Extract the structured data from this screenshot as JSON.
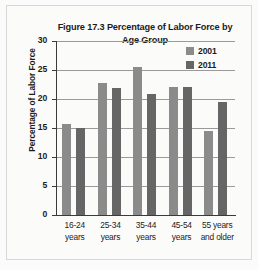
{
  "figure": {
    "title": "Figure 17.3 Percentage of Labor Force by Age Group",
    "title_line1": "Figure 17.3 Percentage of Labor Force",
    "title_line2": "by Age Group",
    "y_axis_title": "Percentage of Labor Force",
    "colors": {
      "series_2001": "#8b8b8b",
      "series_2011": "#666666",
      "gridline": "#9a9a9a",
      "axis": "#3a3a3a",
      "text": "#1c1c1c",
      "background": "#fbfbfa",
      "frame_border": "#d8d8d6"
    },
    "legend": [
      {
        "label": "2001",
        "color": "#8b8b8b"
      },
      {
        "label": "2011",
        "color": "#666666"
      }
    ],
    "y_ticks": [
      "30",
      "25",
      "20",
      "15",
      "10",
      "5",
      "0"
    ],
    "x_tick_labels": [
      {
        "line1": "16-24",
        "line2": "years"
      },
      {
        "line1": "25-34",
        "line2": "years"
      },
      {
        "line1": "35-44",
        "line2": "years"
      },
      {
        "line1": "45-54",
        "line2": "years"
      },
      {
        "line1": "55 years",
        "line2": "and older"
      }
    ]
  },
  "chart_data": {
    "type": "bar",
    "title": "Figure 17.3 Percentage of Labor Force by Age Group",
    "xlabel": "",
    "ylabel": "Percentage of Labor Force",
    "categories": [
      "16-24 years",
      "25-34 years",
      "35-44 years",
      "45-54 years",
      "55 years and older"
    ],
    "series": [
      {
        "name": "2001",
        "color": "#8b8b8b",
        "values": [
          15.7,
          22.7,
          25.5,
          22.0,
          14.4
        ]
      },
      {
        "name": "2011",
        "color": "#666666",
        "values": [
          15.0,
          21.9,
          20.9,
          22.0,
          19.4
        ]
      }
    ],
    "ylim": [
      0,
      30
    ],
    "ytick_step": 5,
    "grid": true,
    "legend_position": "top-right"
  }
}
